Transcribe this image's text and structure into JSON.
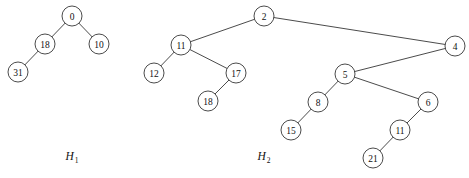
{
  "figure": {
    "background_color": "#ffffff",
    "stroke_color": "#2a2a2a",
    "node_fill_color": "#ffffff",
    "node_radius": 10
  },
  "heaps": [
    {
      "id": "H1",
      "caption_base": "H",
      "caption_sub": "1",
      "caption_x": 72,
      "caption_y": 160,
      "nodes": [
        {
          "key": "0",
          "x": 72,
          "y": 16
        },
        {
          "key": "18",
          "x": 45,
          "y": 44
        },
        {
          "key": "10",
          "x": 99,
          "y": 44
        },
        {
          "key": "31",
          "x": 18,
          "y": 72
        }
      ],
      "edges": [
        {
          "from": "0",
          "to": "18"
        },
        {
          "from": "0",
          "to": "10"
        },
        {
          "from": "18",
          "to": "31"
        }
      ]
    },
    {
      "id": "H2",
      "caption_base": "H",
      "caption_sub": "2",
      "caption_x": 264,
      "caption_y": 160,
      "nodes": [
        {
          "key": "2",
          "x": 264,
          "y": 16
        },
        {
          "key": "11",
          "x": 181,
          "y": 45
        },
        {
          "key": "4",
          "x": 455,
          "y": 46
        },
        {
          "key": "12",
          "x": 154,
          "y": 73
        },
        {
          "key": "17",
          "x": 236,
          "y": 73
        },
        {
          "key": "5",
          "x": 345,
          "y": 74
        },
        {
          "key": "18",
          "x": 208,
          "y": 101
        },
        {
          "key": "8",
          "x": 318,
          "y": 102
        },
        {
          "key": "6",
          "x": 428,
          "y": 102
        },
        {
          "key": "15",
          "x": 291,
          "y": 130
        },
        {
          "key": "11b",
          "x": 400,
          "y": 130,
          "display": "11"
        },
        {
          "key": "21",
          "x": 373,
          "y": 158
        }
      ],
      "edges": [
        {
          "from": "2",
          "to": "11"
        },
        {
          "from": "2",
          "to": "4"
        },
        {
          "from": "11",
          "to": "12"
        },
        {
          "from": "11",
          "to": "17"
        },
        {
          "from": "17",
          "to": "18"
        },
        {
          "from": "4",
          "to": "5"
        },
        {
          "from": "5",
          "to": "8"
        },
        {
          "from": "5",
          "to": "6"
        },
        {
          "from": "8",
          "to": "15"
        },
        {
          "from": "6",
          "to": "11b"
        },
        {
          "from": "11b",
          "to": "21"
        }
      ]
    }
  ],
  "chart_data": {
    "type": "diagram",
    "diagram_kind": "binomial-heap-forest",
    "trees": [
      {
        "name": "H1",
        "root": "0",
        "adjacency": {
          "0": [
            "18",
            "10"
          ],
          "18": [
            "31"
          ],
          "10": [],
          "31": []
        },
        "keys": [
          "0",
          "18",
          "10",
          "31"
        ]
      },
      {
        "name": "H2",
        "root": "2",
        "adjacency": {
          "2": [
            "11",
            "4"
          ],
          "11": [
            "12",
            "17"
          ],
          "17": [
            "18"
          ],
          "4": [
            "5"
          ],
          "5": [
            "8",
            "6"
          ],
          "8": [
            "15"
          ],
          "6": [
            "11"
          ],
          "11_child": [
            "21"
          ]
        },
        "keys": [
          "2",
          "11",
          "4",
          "12",
          "17",
          "5",
          "18",
          "8",
          "6",
          "15",
          "11",
          "21"
        ]
      }
    ]
  }
}
